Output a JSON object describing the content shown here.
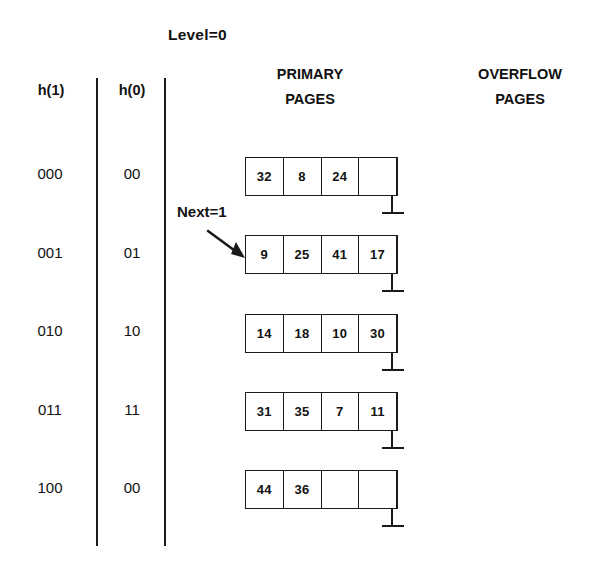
{
  "diagram": {
    "level_label": "Level=0",
    "next_label": "Next=1",
    "columns": {
      "h1_header": "h(1)",
      "h0_header": "h(0)",
      "primary_header_line1": "PRIMARY",
      "primary_header_line2": "PAGES",
      "overflow_header_line1": "OVERFLOW",
      "overflow_header_line2": "PAGES"
    },
    "rows": [
      {
        "h1": "000",
        "h0": "00",
        "slots": [
          "32",
          "8",
          "24",
          ""
        ]
      },
      {
        "h1": "001",
        "h0": "01",
        "slots": [
          "9",
          "25",
          "41",
          "17"
        ]
      },
      {
        "h1": "010",
        "h0": "10",
        "slots": [
          "14",
          "18",
          "10",
          "30"
        ]
      },
      {
        "h1": "011",
        "h0": "11",
        "slots": [
          "31",
          "35",
          "7",
          "11"
        ]
      },
      {
        "h1": "100",
        "h0": "00",
        "slots": [
          "44",
          "36",
          "",
          ""
        ]
      }
    ],
    "next_points_to_row_index": 1,
    "colors": {
      "background": "#ffffff",
      "ink": "#1a1a1a",
      "text": "#111111"
    }
  }
}
